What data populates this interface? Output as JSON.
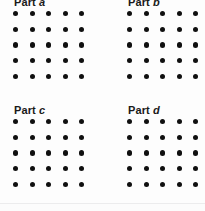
{
  "figure": {
    "background_color": "#fdfdfd",
    "dot_color": "#101010",
    "label_color": "#1a1a1a",
    "divider_color": "#ececed",
    "panels": [
      {
        "id": "a",
        "label_prefix": "Part ",
        "label_letter": "a",
        "label_full": "Part a",
        "label_clipped": true,
        "rows": 5,
        "columns": 5,
        "dot_count": 25
      },
      {
        "id": "b",
        "label_prefix": "Part ",
        "label_letter": "b",
        "label_full": "Part b",
        "label_clipped": true,
        "rows": 5,
        "columns": 5,
        "dot_count": 25
      },
      {
        "id": "c",
        "label_prefix": "Part ",
        "label_letter": "c",
        "label_full": "Part c",
        "label_clipped": false,
        "rows": 5,
        "columns": 5,
        "dot_count": 25
      },
      {
        "id": "d",
        "label_prefix": "Part ",
        "label_letter": "d",
        "label_full": "Part d",
        "label_clipped": false,
        "rows": 5,
        "columns": 5,
        "dot_count": 25
      }
    ]
  },
  "chart_data": {
    "type": "scatter",
    "title": "",
    "subtitle": "",
    "xlabel": "",
    "ylabel": "",
    "grid": false,
    "legend_position": "none",
    "panels": [
      {
        "name": "Part a",
        "rows": 5,
        "columns": 5,
        "values": [
          [
            1,
            1,
            1,
            1,
            1
          ],
          [
            1,
            1,
            1,
            1,
            1
          ],
          [
            1,
            1,
            1,
            1,
            1
          ],
          [
            1,
            1,
            1,
            1,
            1
          ],
          [
            1,
            1,
            1,
            1,
            1
          ]
        ],
        "total": 25
      },
      {
        "name": "Part b",
        "rows": 5,
        "columns": 5,
        "values": [
          [
            1,
            1,
            1,
            1,
            1
          ],
          [
            1,
            1,
            1,
            1,
            1
          ],
          [
            1,
            1,
            1,
            1,
            1
          ],
          [
            1,
            1,
            1,
            1,
            1
          ],
          [
            1,
            1,
            1,
            1,
            1
          ]
        ],
        "total": 25
      },
      {
        "name": "Part c",
        "rows": 5,
        "columns": 5,
        "values": [
          [
            1,
            1,
            1,
            1,
            1
          ],
          [
            1,
            1,
            1,
            1,
            1
          ],
          [
            1,
            1,
            1,
            1,
            1
          ],
          [
            1,
            1,
            1,
            1,
            1
          ],
          [
            1,
            1,
            1,
            1,
            1
          ]
        ],
        "total": 25
      },
      {
        "name": "Part d",
        "rows": 5,
        "columns": 5,
        "values": [
          [
            1,
            1,
            1,
            1,
            1
          ],
          [
            1,
            1,
            1,
            1,
            1
          ],
          [
            1,
            1,
            1,
            1,
            1
          ],
          [
            1,
            1,
            1,
            1,
            1
          ],
          [
            1,
            1,
            1,
            1,
            1
          ]
        ],
        "total": 25
      }
    ]
  }
}
